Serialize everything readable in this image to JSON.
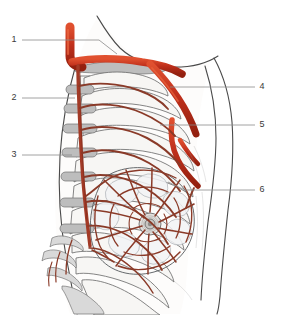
{
  "figure": {
    "view": "Right lateral / oblique view of the thorax",
    "background_color": "#ffffff",
    "width": 281,
    "height": 315
  },
  "colors": {
    "artery_major": "#c0301c",
    "artery_major_highlight": "#e2502f",
    "artery_mid": "#a33a26",
    "artery_fine": "#8a3a28",
    "bone_outline": "#6f6f6f",
    "bone_fill": "#f7f6f4",
    "cartilage": "#d9d9d9",
    "body_outline": "#4a4a4a",
    "leader_line": "#8a8a8a",
    "label_text": "#3a3a3a"
  },
  "labels": [
    {
      "id": "1",
      "text": "1",
      "side": "left",
      "text_x": 14,
      "text_y": 40,
      "line_from_x": 22,
      "line_to_x": 99,
      "line_y": 40,
      "target_x": 117,
      "target_y": 54
    },
    {
      "id": "2",
      "text": "2",
      "side": "left",
      "text_x": 14,
      "text_y": 98,
      "line_from_x": 22,
      "line_to_x": 75,
      "line_y": 98,
      "target_x": 75,
      "target_y": 98
    },
    {
      "id": "3",
      "text": "3",
      "side": "left",
      "text_x": 14,
      "text_y": 155,
      "line_from_x": 22,
      "line_to_x": 72,
      "line_y": 155,
      "target_x": 72,
      "target_y": 155
    },
    {
      "id": "4",
      "text": "4",
      "side": "right",
      "text_x": 262,
      "text_y": 87,
      "line_from_x": 255,
      "line_to_x": 170,
      "line_y": 87,
      "target_x": 170,
      "target_y": 87
    },
    {
      "id": "5",
      "text": "5",
      "side": "right",
      "text_x": 262,
      "text_y": 125,
      "line_from_x": 255,
      "line_to_x": 160,
      "line_y": 125,
      "target_x": 160,
      "target_y": 125
    },
    {
      "id": "6",
      "text": "6",
      "side": "right",
      "text_x": 262,
      "text_y": 190,
      "line_from_x": 255,
      "line_to_x": 185,
      "line_y": 190,
      "target_x": 168,
      "target_y": 182
    }
  ],
  "structures": [
    {
      "name": "subclavian-artery",
      "label_id": "1",
      "kind": "artery"
    },
    {
      "name": "internal-thoracic-artery",
      "label_id": "2",
      "kind": "artery"
    },
    {
      "name": "anterior-intercostal-arteries",
      "label_id": "3",
      "kind": "artery"
    },
    {
      "name": "axillary-artery",
      "label_id": "4",
      "kind": "artery"
    },
    {
      "name": "lateral-thoracic-artery",
      "label_id": "5",
      "kind": "artery"
    },
    {
      "name": "breast-mammary-gland",
      "label_id": "6",
      "kind": "soft-tissue"
    }
  ]
}
